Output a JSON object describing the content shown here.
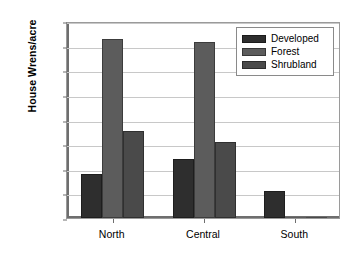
{
  "chart_data": {
    "type": "bar",
    "title": "",
    "subtitle": "",
    "xlabel": "",
    "ylabel": "House Wrens/acre",
    "categories": [
      "North",
      "Central",
      "South"
    ],
    "series": [
      {
        "name": "Developed",
        "color": "#2e2e2e",
        "values": [
          0.36,
          0.48,
          0.22
        ]
      },
      {
        "name": "Forest",
        "color": "#5c5c5c",
        "values": [
          1.45,
          1.43,
          0.01
        ]
      },
      {
        "name": "Shrubland",
        "color": "#4a4a4a",
        "values": [
          0.71,
          0.62,
          0.01
        ]
      }
    ],
    "ylim": [
      0.0,
      1.6
    ],
    "ytick_values": [
      0.0,
      0.2,
      0.4,
      0.6,
      0.8,
      1.0,
      1.2,
      1.4,
      1.6
    ],
    "ytick_labels": [
      "0.0",
      "0.2",
      "0.4",
      "0.6",
      "0.8",
      "1.0",
      "1.2",
      "1.4",
      "1.6"
    ],
    "grid": true,
    "grid_axis": "y",
    "legend_position": "top-right",
    "legend_entries": [
      "Developed",
      "Forest",
      "Shrubland"
    ],
    "grid_color": "#c8c8c8",
    "axis_color": "#6e6e6e",
    "background": "#ffffff"
  }
}
